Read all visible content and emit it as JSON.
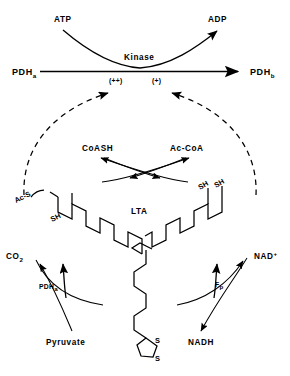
{
  "figure": {
    "background_color": "#ffffff",
    "ink_color": "#000000"
  },
  "kinase_reaction": {
    "substrate_label": "PDH",
    "substrate_subscript": "a",
    "product_label": "PDH",
    "product_subscript": "b",
    "enzyme_label": "Kinase",
    "cosubstrate_label": "ATP",
    "coproduct_label": "ADP",
    "effector_strong": "(++)",
    "effector_weak": "(+)"
  },
  "acetyl_transfer": {
    "left_label": "CoASH",
    "right_label": "Ac-CoA"
  },
  "carrier": {
    "label": "LTA",
    "left_acetyl_thio": "Ac-S",
    "left_thiol": "SH",
    "right_thiol_1": "SH",
    "right_thiol_2": "SH",
    "ring_atom_1": "S",
    "ring_atom_2": "S"
  },
  "decarboxylation": {
    "enzyme_label": "PDH",
    "enzyme_subscript": "a",
    "substrate_label": "Pyruvate",
    "product_label": "CO",
    "product_subscript": "2"
  },
  "reoxidation": {
    "enzyme_label": "F",
    "enzyme_subscript": "p",
    "acceptor_label": "NAD",
    "acceptor_superscript": "+",
    "product_label": "NADH"
  }
}
